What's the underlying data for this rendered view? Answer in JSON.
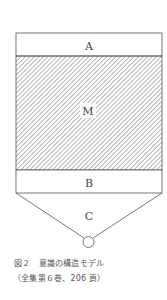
{
  "diagram": {
    "labels": {
      "top_band": "A",
      "middle_region": "M",
      "bottom_band": "B",
      "funnel": "C"
    },
    "colors": {
      "stroke": "#555555",
      "hatch": "#666666",
      "background": "#ffffff"
    }
  },
  "caption": {
    "line1": "図２　意識の構造モデル",
    "line2": "（全集第６巻、206 頁）"
  }
}
